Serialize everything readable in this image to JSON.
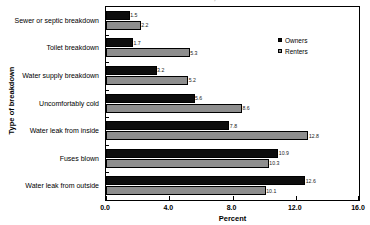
{
  "chart_data": {
    "type": "bar",
    "orientation": "horizontal",
    "title": "in the Last 12 Months, 2001",
    "xlabel": "Percent",
    "ylabel": "Type of breakdown",
    "xlim": [
      0.0,
      16.0
    ],
    "xticks": [
      "0.0",
      "4.0",
      "8.0",
      "12.0",
      "16.0"
    ],
    "xtick_values": [
      0.0,
      4.0,
      8.0,
      12.0,
      16.0
    ],
    "grid": false,
    "legend_position": "upper right",
    "categories": [
      "Sewer or septic breakdown",
      "Toilet breakdown",
      "Water supply breakdown",
      "Uncomfortably cold",
      "Water leak from inside",
      "Fuses blown",
      "Water leak from outside"
    ],
    "series": [
      {
        "name": "Owners",
        "color": "#0d0d0d",
        "values": [
          1.5,
          1.7,
          3.2,
          5.6,
          7.8,
          10.9,
          12.6
        ],
        "labels": [
          "1.5",
          "1.7",
          "3.2",
          "5.6",
          "7.8",
          "10.9",
          "12.6"
        ]
      },
      {
        "name": "Renters",
        "color": "#8e8e8e",
        "values": [
          2.2,
          5.3,
          5.2,
          8.6,
          12.8,
          10.3,
          10.1
        ],
        "labels": [
          "2.2",
          "5.3",
          "5.2",
          "8.6",
          "12.8",
          "10.3",
          "10.1"
        ]
      }
    ]
  }
}
